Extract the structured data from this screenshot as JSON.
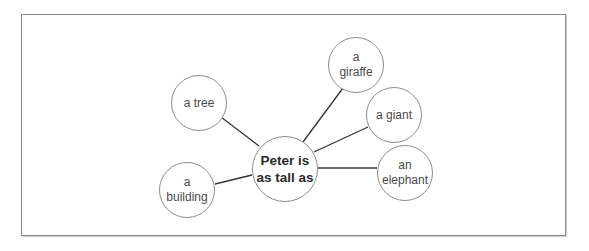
{
  "diagram": {
    "type": "mind-map",
    "center": {
      "label": "Peter is\nas tall as",
      "cx": 285,
      "cy": 169,
      "r": 33
    },
    "nodes": [
      {
        "id": "tree",
        "label": "a tree",
        "cx": 199,
        "cy": 103,
        "r": 28
      },
      {
        "id": "building",
        "label": "a\nbuilding",
        "cx": 187,
        "cy": 190,
        "r": 28
      },
      {
        "id": "giraffe",
        "label": "a\ngiraffe",
        "cx": 356,
        "cy": 65,
        "r": 28
      },
      {
        "id": "giant",
        "label": "a giant",
        "cx": 394,
        "cy": 115,
        "r": 28
      },
      {
        "id": "elephant",
        "label": "an\nelephant",
        "cx": 405,
        "cy": 173,
        "r": 28
      }
    ],
    "edges": [
      {
        "from": "center",
        "to": "tree",
        "x1": 259,
        "y1": 146,
        "x2": 221,
        "y2": 117
      },
      {
        "from": "center",
        "to": "building",
        "x1": 252,
        "y1": 175,
        "x2": 215,
        "y2": 184
      },
      {
        "from": "center",
        "to": "giraffe",
        "x1": 303,
        "y1": 142,
        "x2": 343,
        "y2": 88
      },
      {
        "from": "center",
        "to": "giant",
        "x1": 314,
        "y1": 152,
        "x2": 368,
        "y2": 127
      },
      {
        "from": "center",
        "to": "elephant",
        "x1": 318,
        "y1": 168,
        "x2": 377,
        "y2": 168
      }
    ],
    "colors": {
      "edge": "#333333",
      "node_border": "#8c8c8c",
      "frame_border": "#8a8a8a",
      "text": "#4a4a4a",
      "center_text": "#2b2b2b"
    }
  }
}
